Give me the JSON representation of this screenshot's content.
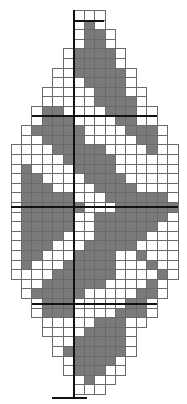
{
  "pattern": {
    "title": "",
    "cols": 16,
    "cell_w": 10.45,
    "cell_h": 10.0,
    "origin_x": 10.5,
    "origin_y": 10,
    "colors": {
      "filled": "#7a7a7a",
      "empty": "#ffffff",
      "grid": "#6a6a6a",
      "guide": "#111111"
    },
    "guides": {
      "vertical_x": 73,
      "vertical_y0": 10,
      "vertical_y1": 397,
      "horizontal": [
        {
          "y": 20,
          "x0": 73,
          "x1": 104
        },
        {
          "y": 115,
          "x0": 32,
          "x1": 157
        },
        {
          "y": 206,
          "x0": 11,
          "x1": 178
        },
        {
          "y": 303,
          "x0": 32,
          "x1": 157
        },
        {
          "y": 397,
          "x0": 52,
          "x1": 87
        }
      ]
    },
    "rows": [
      "......www.......",
      "......wgw.......",
      "......wggw......",
      "......wggw......",
      ".....wggggw.....",
      ".....wggggw.....",
      "....wwgggggw....",
      "....wwwggggw....",
      "...wwwwwgggww...",
      "...wwwwwggggw...",
      "..wggwwwwgggww..",
      "..wgggwwwwggww..",
      ".wgggggwwwwgggw.",
      ".wwggggwwwwwggw.",
      "wwwwgggggwwwwgww",
      "wwwwwgggggwwwwww",
      "wgwwwwggggwwwwww",
      "wggwwwwggggwwwww",
      "wgggwwwwggggwwww",
      "wgggggwwwggggggw",
      "wggggggwwwgggggg",
      "wgggggwwgggggggw",
      "wgggggwwggggggww",
      "wggggwwwgggggwww",
      "wgggwwwgggggwwww",
      "wggwwwggggwwgwww",
      "wgwwwgggggwwwgww",
      "wwwwggggggwwwwgw",
      ".wwggggggwwwwgw.",
      ".wgggggwwwwwggw.",
      "..wgggwwwwwggw..",
      "..wgggwwwwgggw..",
      "...wwwwwgggww...",
      "...wwwwggggw....",
      "....wwgggggw....",
      "....wggggggw....",
      ".....wggggw.....",
      ".....wgggww.....",
      "......wgww......",
      "......www......."
    ]
  }
}
